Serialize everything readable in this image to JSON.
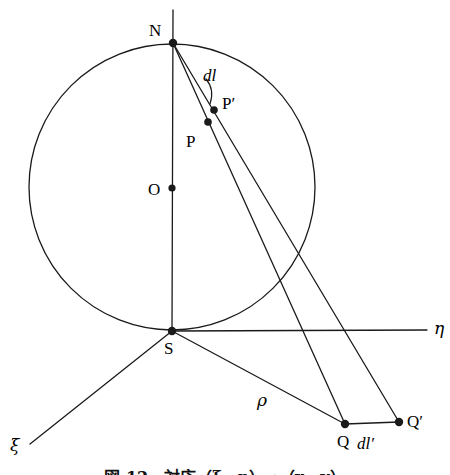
{
  "figure": {
    "type": "geometry-diagram",
    "background_color": "#ffffff",
    "stroke_color": "#1a1a1a"
  },
  "points": [
    {
      "id": "N",
      "label": "N",
      "x": 173,
      "y": 43,
      "label_x": 149,
      "label_y": 22,
      "dot": true,
      "dot_r": 4.2
    },
    {
      "id": "O",
      "label": "O",
      "x": 172,
      "y": 188,
      "label_x": 148,
      "label_y": 181,
      "dot": true,
      "dot_r": 3.6
    },
    {
      "id": "P",
      "label": "P",
      "x": 208,
      "y": 122,
      "label_x": 186,
      "label_y": 133,
      "dot": true,
      "dot_r": 3.8
    },
    {
      "id": "Pp",
      "label": "P′",
      "x": 214,
      "y": 110,
      "label_x": 222,
      "label_y": 95,
      "dot": true,
      "dot_r": 3.8
    },
    {
      "id": "S",
      "label": "S",
      "x": 172,
      "y": 331,
      "label_x": 164,
      "label_y": 340,
      "dot": true,
      "dot_r": 4.2
    },
    {
      "id": "Q",
      "label": "Q",
      "x": 345,
      "y": 424,
      "label_x": 337,
      "label_y": 433,
      "dot": true,
      "dot_r": 4.2
    },
    {
      "id": "Qp",
      "label": "Q′",
      "x": 399,
      "y": 422,
      "label_x": 407,
      "label_y": 413,
      "dot": true,
      "dot_r": 4.2
    }
  ],
  "circle": {
    "name": "meridian-circle",
    "cx": 172,
    "cy": 187,
    "r": 143
  },
  "lines": [
    {
      "name": "polar-axis",
      "x1": 173,
      "y1": 10,
      "x2": 172,
      "y2": 331
    },
    {
      "name": "eta-axis",
      "x1": 172,
      "y1": 331,
      "x2": 427,
      "y2": 330
    },
    {
      "name": "xi-axis",
      "x1": 172,
      "y1": 331,
      "x2": 30,
      "y2": 444
    },
    {
      "name": "rho-ray-S-to-Q",
      "x1": 172,
      "y1": 331,
      "x2": 345,
      "y2": 424
    },
    {
      "name": "ray-N-to-Q",
      "x1": 173,
      "y1": 43,
      "x2": 345,
      "y2": 424
    },
    {
      "name": "ray-N-to-Qprime",
      "x1": 173,
      "y1": 43,
      "x2": 399,
      "y2": 422
    },
    {
      "name": "segment-Q-to-Qprime",
      "x1": 345,
      "y1": 424,
      "x2": 399,
      "y2": 422
    }
  ],
  "leader": {
    "name": "dl-leader-arc",
    "path": "M 206 79 C 212 86, 213 95, 210 104"
  },
  "labels": [
    {
      "id": "dl",
      "text": "dl",
      "x": 203,
      "y": 67,
      "style": "italic"
    },
    {
      "id": "dlp",
      "text": "dl′",
      "x": 357,
      "y": 435,
      "style": "italic"
    },
    {
      "id": "rho",
      "text": "ρ",
      "x": 257,
      "y": 392,
      "style": "greek"
    },
    {
      "id": "eta",
      "text": "η",
      "x": 434,
      "y": 320,
      "style": "greek"
    },
    {
      "id": "xi",
      "text": "ξ",
      "x": 10,
      "y": 437,
      "style": "greek"
    }
  ],
  "caption": {
    "text": "図 12　対応（ξ、η）→（x、y）",
    "note": "caption cropped at bottom edge of screenshot"
  }
}
